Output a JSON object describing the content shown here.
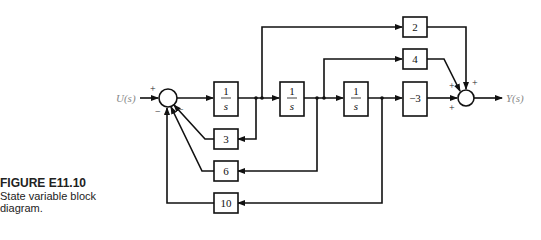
{
  "caption": {
    "figure_number": "FIGURE E11.10",
    "description": "State variable block diagram."
  },
  "signals": {
    "input": "U(s)",
    "output": "Y(s)"
  },
  "blocks": {
    "integrator1": {
      "num": "1",
      "den": "s"
    },
    "integrator2": {
      "num": "1",
      "den": "s"
    },
    "integrator3": {
      "num": "1",
      "den": "s"
    },
    "gain_ff_top": "2",
    "gain_ff_mid": "4",
    "gain_ff_direct": "−3",
    "gain_fb_3": "3",
    "gain_fb_6": "6",
    "gain_fb_10": "10"
  },
  "input_summer_signs": {
    "input": "+",
    "fb_3": "−",
    "fb_6": "−",
    "fb_10": "−"
  },
  "output_summer_signs": {
    "from_4": "+",
    "from_2": "+",
    "from_neg3": "+"
  },
  "colors": {
    "line": "#111111",
    "label_gray": "#888888"
  }
}
